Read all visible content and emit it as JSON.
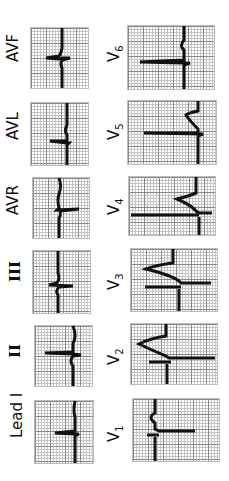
{
  "limb_leads": [
    {
      "label": "AVF"
    },
    {
      "label": "AVL"
    },
    {
      "label": "AVR"
    },
    {
      "label": "III"
    },
    {
      "label": "II"
    },
    {
      "label": "Lead I"
    }
  ],
  "precordial_leads": [
    {
      "label": "V",
      "sub": "6"
    },
    {
      "label": "V",
      "sub": "5"
    },
    {
      "label": "V",
      "sub": "4"
    },
    {
      "label": "V",
      "sub": "3"
    },
    {
      "label": "V",
      "sub": "2"
    },
    {
      "label": "V",
      "sub": "1"
    }
  ],
  "colors": {
    "trace": "#111111",
    "grid_major": "#8a8a8a",
    "grid_minor": "#c4c4c4",
    "background": "#ffffff"
  }
}
